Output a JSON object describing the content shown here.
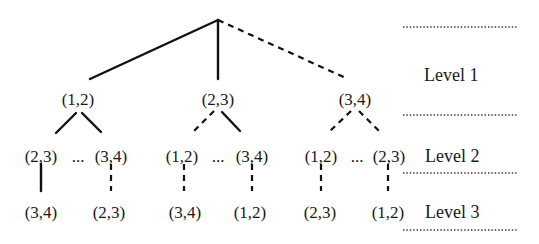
{
  "diagram": {
    "type": "tree",
    "root": {
      "label": "",
      "x": 218,
      "y": 20
    },
    "level1": [
      {
        "label": "(1,2)",
        "x": 78,
        "edge": "solid"
      },
      {
        "label": "(2,3)",
        "x": 218,
        "edge": "solid"
      },
      {
        "label": "(3,4)",
        "x": 355,
        "edge": "dashed"
      }
    ],
    "level2": [
      {
        "label": "(2,3)",
        "parent": "(1,2)",
        "edge": "solid"
      },
      {
        "label": "...",
        "separator": true
      },
      {
        "label": "(3,4)",
        "parent": "(1,2)",
        "edge": "solid"
      },
      {
        "label": "(1,2)",
        "parent": "(2,3)",
        "edge": "dashed"
      },
      {
        "label": "...",
        "separator": true
      },
      {
        "label": "(3,4)",
        "parent": "(2,3)",
        "edge": "solid"
      },
      {
        "label": "(1,2)",
        "parent": "(3,4)",
        "edge": "dashed"
      },
      {
        "label": "...",
        "separator": true
      },
      {
        "label": "(2,3)",
        "parent": "(3,4)",
        "edge": "dashed"
      }
    ],
    "level3": [
      {
        "label": "(3,4)",
        "parent": "(2,3)",
        "edge": "solid"
      },
      {
        "label": "(2,3)",
        "parent": "(3,4)",
        "edge": "dashed"
      },
      {
        "label": "(3,4)",
        "parent": "(1,2)",
        "edge": "dashed"
      },
      {
        "label": "(1,2)",
        "parent": "(3,4)",
        "edge": "dashed"
      },
      {
        "label": "(2,3)",
        "parent": "(1,2)",
        "edge": "dashed"
      },
      {
        "label": "(1,2)",
        "parent": "(2,3)",
        "edge": "dashed"
      }
    ],
    "level_labels": [
      "Level 1",
      "Level 2",
      "Level 3"
    ],
    "text": {
      "n1_12": "(1,2)",
      "n1_23": "(2,3)",
      "n1_34": "(3,4)",
      "n2_a": "(2,3)",
      "n2_b": "(3,4)",
      "n2_c": "(1,2)",
      "n2_d": "(3,4)",
      "n2_e": "(1,2)",
      "n2_f": "(2,3)",
      "ellipsis": "...",
      "n3_a": "(3,4)",
      "n3_b": "(2,3)",
      "n3_c": "(3,4)",
      "n3_d": "(1,2)",
      "n3_e": "(2,3)",
      "n3_f": "(1,2)",
      "level1": "Level 1",
      "level2": "Level 2",
      "level3": "Level 3"
    }
  }
}
